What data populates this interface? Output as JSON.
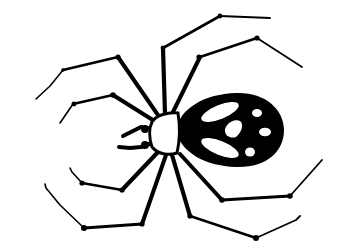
{
  "illustration": {
    "subject": "spider",
    "style": "black ink silhouette clip-art",
    "colors": {
      "background": "#ffffff",
      "ink": "#000000",
      "highlight": "#ffffff"
    },
    "parts": {
      "cephalothorax": "white head section with black outline",
      "abdomen": "black oval with white markings",
      "legs": 8,
      "pedipalps": 2
    }
  }
}
